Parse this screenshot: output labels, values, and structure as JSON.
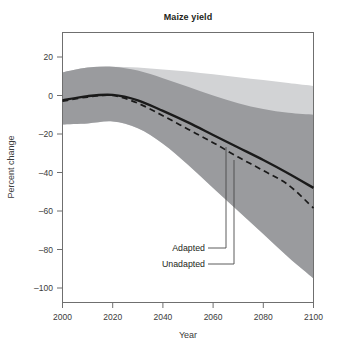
{
  "chart_data": {
    "type": "line",
    "title": "Maize yield",
    "xlabel": "Year",
    "ylabel": "Percent change",
    "xlim": [
      2000,
      2100
    ],
    "ylim": [
      -100,
      20
    ],
    "xticks": [
      "2000",
      "2020",
      "2040",
      "2060",
      "2080",
      "2100"
    ],
    "yticks": [
      "20",
      "0",
      "–20",
      "–40",
      "–60",
      "–80",
      "–100"
    ],
    "grid": false,
    "legend_position": "inline-annotations",
    "annotations": [
      {
        "label": "Adapted",
        "target_series": "Adapted",
        "target_x": 2063,
        "target_y": -23
      },
      {
        "label": "Unadapted",
        "target_series": "Unadapted",
        "target_x": 2070,
        "target_y": -30
      }
    ],
    "x": [
      2000,
      2010,
      2020,
      2030,
      2040,
      2050,
      2060,
      2070,
      2080,
      2090,
      2100
    ],
    "series": [
      {
        "name": "Adapted",
        "style": "solid",
        "color": "#1a1a1a",
        "values": [
          -2.5,
          -0.3,
          0.3,
          -2.5,
          -8.0,
          -14.0,
          -20.5,
          -27.0,
          -33.5,
          -40.5,
          -48.0
        ]
      },
      {
        "name": "Unadapted",
        "style": "dashed",
        "color": "#1a1a1a",
        "values": [
          -3.0,
          -0.8,
          0.0,
          -4.0,
          -10.5,
          -17.5,
          -24.5,
          -32.0,
          -39.0,
          -46.5,
          -58.5
        ]
      }
    ],
    "bands": [
      {
        "name": "Wide range (light)",
        "color": "#d2d3d5",
        "upper": [
          12.0,
          14.5,
          15.0,
          14.5,
          13.5,
          12.5,
          11.0,
          9.5,
          8.0,
          6.5,
          5.0
        ],
        "lower": [
          -15.0,
          -14.5,
          -13.5,
          -17.0,
          -25.0,
          -36.0,
          -48.0,
          -60.0,
          -72.0,
          -84.0,
          -95.0
        ]
      },
      {
        "name": "Inner range (dark)",
        "color": "#9a9b9e",
        "upper": [
          12.0,
          14.5,
          15.0,
          13.0,
          9.0,
          4.5,
          0.0,
          -4.0,
          -7.0,
          -9.0,
          -10.0
        ],
        "lower": [
          -15.0,
          -14.5,
          -13.5,
          -17.0,
          -25.0,
          -36.0,
          -48.0,
          -60.0,
          -72.0,
          -84.0,
          -95.0
        ]
      }
    ]
  },
  "colors": {
    "band_light": "#d2d3d5",
    "band_dark": "#9a9b9e",
    "line": "#1a1a1a",
    "frame": "#6f6f6f",
    "text": "#231f20",
    "background": "#ffffff"
  }
}
